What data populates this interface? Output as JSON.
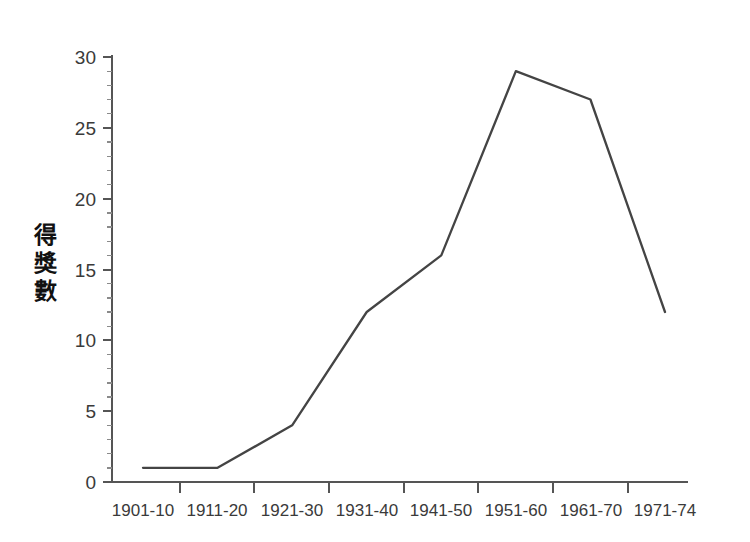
{
  "chart_data": {
    "type": "line",
    "title": "",
    "xlabel": "",
    "ylabel": "得獎數",
    "ylabel_chars": [
      "得",
      "獎",
      "數"
    ],
    "categories": [
      "1901-10",
      "1911-20",
      "1921-30",
      "1931-40",
      "1941-50",
      "1951-60",
      "1961-70",
      "1971-74"
    ],
    "values": [
      1,
      1,
      4,
      12,
      16,
      29,
      27,
      12
    ],
    "series": [
      {
        "name": "得獎數",
        "values": [
          1,
          1,
          4,
          12,
          16,
          29,
          27,
          12
        ]
      }
    ],
    "ylim": [
      0,
      30
    ],
    "y_ticks": [
      "0",
      "5",
      "10",
      "15",
      "20",
      "25",
      "30"
    ],
    "y_tick_values": [
      0,
      5,
      10,
      15,
      20,
      25,
      30
    ],
    "y_minor_step": 1,
    "grid": false,
    "legend": false,
    "legend_position": "none",
    "line_color": "#444444",
    "axis_color": "#555555",
    "text_color": "#3a3a3a",
    "background_color": "#ffffff"
  }
}
